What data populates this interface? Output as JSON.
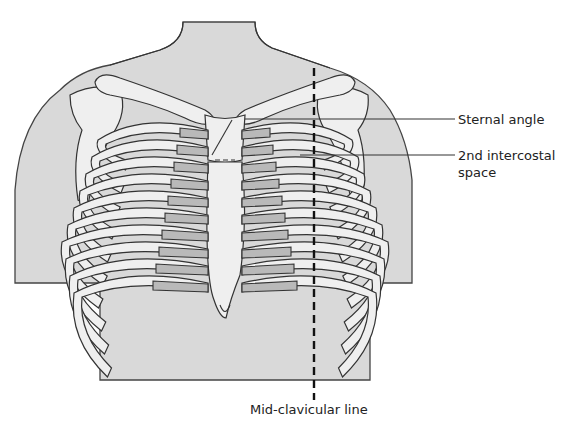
{
  "figure": {
    "labels": {
      "sternal_angle": "Sternal angle",
      "intercostal_line1": "2nd intercostal",
      "intercostal_line2": "space",
      "midclavicular": "Mid-clavicular line"
    },
    "colors": {
      "skin": "#d9d9d9",
      "bone": "#efefef",
      "cartilage": "#b9b9b9",
      "outline": "#333333"
    }
  }
}
